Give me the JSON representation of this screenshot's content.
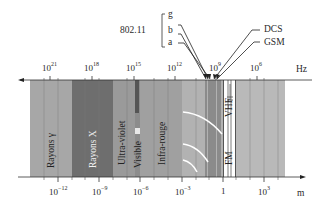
{
  "top_axis": {
    "unit": "Hz",
    "ticks": [
      {
        "base": "10",
        "exp": "21",
        "x": 50
      },
      {
        "base": "10",
        "exp": "18",
        "x": 92
      },
      {
        "base": "10",
        "exp": "15",
        "x": 134
      },
      {
        "base": "10",
        "exp": "12",
        "x": 175
      },
      {
        "base": "10",
        "exp": "9",
        "x": 216
      },
      {
        "base": "10",
        "exp": "6",
        "x": 257
      }
    ]
  },
  "bottom_axis": {
    "unit": "m",
    "ticks": [
      {
        "base": "10",
        "exp": "−12",
        "x": 58
      },
      {
        "base": "10",
        "exp": "−9",
        "x": 99
      },
      {
        "base": "10",
        "exp": "−6",
        "x": 140
      },
      {
        "base": "10",
        "exp": "−3",
        "x": 182
      },
      {
        "base": "1",
        "exp": "",
        "x": 223
      },
      {
        "base": "10",
        "exp": "3",
        "x": 264
      }
    ]
  },
  "bands": [
    {
      "name": "Rayons γ",
      "x0": 30,
      "x1": 72,
      "color": "#a7a7a7"
    },
    {
      "name": "Rayons X",
      "x0": 72,
      "x1": 113,
      "color": "#6e6e6e"
    },
    {
      "name": "Ultra-violet",
      "x0": 113,
      "x1": 135,
      "color": "#9a9a9a"
    },
    {
      "name": "Visible",
      "x0": 135,
      "x1": 140,
      "color": "#8c8c8c"
    },
    {
      "name": "Infra-rouge",
      "x0": 140,
      "x1": 182,
      "color": "#a0a0a0"
    },
    {
      "name": "Micro-ondes",
      "x0": 182,
      "x1": 223,
      "color": "#b2b2b2"
    },
    {
      "name": "VHF / FM",
      "x0": 223,
      "x1": 236,
      "color": "#ffffff"
    },
    {
      "name": "Radio",
      "x0": 236,
      "x1": 285,
      "color": "#b9b9b9"
    }
  ],
  "labels": {
    "gamma": "Rayons γ",
    "xray": "Rayons X",
    "uv": "Ultra-violet",
    "visible": "Visible",
    "ir": "Infra-rouge",
    "vhf": "VHF",
    "fm": "FM",
    "wifi": "802.11",
    "wifi_g": "g",
    "wifi_b": "b",
    "wifi_a": "a",
    "dcs": "DCS",
    "gsm": "GSM",
    "hz": "Hz",
    "m": "m"
  }
}
